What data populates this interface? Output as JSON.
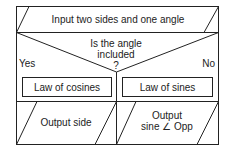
{
  "flowchart": {
    "input_step": "Input two sides and one angle",
    "decision": {
      "line1": "Is the angle",
      "line2": "included",
      "line3": "?",
      "yes_label": "Yes",
      "no_label": "No"
    },
    "process_left": "Law of cosines",
    "process_right": "Law of sines",
    "output_left": "Output side",
    "output_right_line1": "Output",
    "output_right_line2": "sine ∠ Opp"
  },
  "colors": {
    "stroke": "#222222",
    "background": "#ffffff"
  }
}
